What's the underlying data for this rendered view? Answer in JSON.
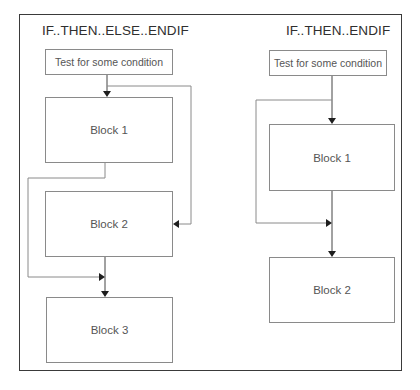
{
  "diagram": {
    "left_panel": {
      "title": "IF..THEN..ELSE..ENDIF",
      "test_box": "Test for some condition",
      "blocks": [
        "Block 1",
        "Block 2",
        "Block 3"
      ]
    },
    "right_panel": {
      "title": "IF..THEN..ENDIF",
      "test_box": "Test for some condition",
      "blocks": [
        "Block 1",
        "Block 2"
      ]
    },
    "colors": {
      "frame": "#3a3a3a",
      "box_border": "#8a8a8a",
      "text": "#555555",
      "arrowhead": "#1e1e1e"
    }
  }
}
